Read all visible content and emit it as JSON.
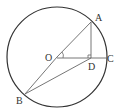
{
  "diagram": {
    "type": "circle-geometry",
    "circle": {
      "center": "O",
      "cx": 57,
      "cy": 57,
      "r": 50
    },
    "points": {
      "A": {
        "label": "A",
        "x": 91,
        "y": 22
      },
      "B": {
        "label": "B",
        "x": 25,
        "y": 94
      },
      "C": {
        "label": "C",
        "x": 107,
        "y": 58
      },
      "D": {
        "label": "D",
        "x": 91,
        "y": 58
      },
      "O": {
        "label": "O",
        "x": 57,
        "y": 57
      }
    },
    "segments": [
      "OA",
      "OB",
      "OC",
      "AD",
      "BD"
    ],
    "marks": {
      "right_angle": "at D (AD ⟂ OC)",
      "angle_arc": "at O between OA and OC"
    },
    "colors": {
      "stroke": "#333333",
      "segment": "#666666",
      "background": "#ffffff"
    }
  }
}
